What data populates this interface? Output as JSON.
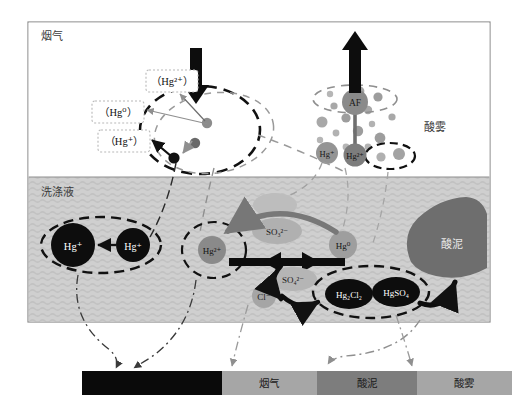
{
  "figure": {
    "zones": {
      "flue_gas_label": "烟气",
      "scrub_liquid_label": "洗涤液",
      "acid_mist_label": "酸雾",
      "acid_sludge_label": "酸泥"
    },
    "colors": {
      "frame_border": "#8a8a8a",
      "flue_gas_bg": "#ffffff",
      "scrub_liquid_bg": "#cfcfcf",
      "black": "#111111",
      "mid_gray": "#8c8c8c",
      "light_gray": "#b4b4b4",
      "dark_gray_blob": "#6e6e6e",
      "legend_dark": "#9a9a9a"
    }
  },
  "gas_zone": {
    "species_boxes": [
      {
        "id": "hg2plus",
        "label": "（Hg²⁺）",
        "x": 146,
        "y": 70
      },
      {
        "id": "hg0",
        "label": "（Hg⁰）",
        "x": 92,
        "y": 101
      },
      {
        "id": "hgplus",
        "label": "（Hg⁺）",
        "x": 98,
        "y": 130
      }
    ],
    "droplet_particles": [
      {
        "id": "gray-particle-upper",
        "label": "",
        "color": "#8c8c8c"
      },
      {
        "id": "gray-particle-mid",
        "label": "",
        "color": "#666666"
      },
      {
        "id": "black-particle",
        "label": "",
        "color": "#111111"
      }
    ],
    "arrows": {
      "inlet_label": "",
      "outlet_label": ""
    }
  },
  "acid_mist_cluster": {
    "af_label": "AF",
    "hg_plus_label": "Hg⁺",
    "hg_2plus_label": "Hg²⁺"
  },
  "liquid_zone": {
    "left_pair": [
      {
        "id": "hg-plus-left",
        "label": "Hg⁺"
      },
      {
        "id": "hg-plus-right",
        "label": "Hg⁺"
      }
    ],
    "center_species": [
      {
        "id": "hg-2plus-center",
        "label": "Hg²⁺"
      },
      {
        "id": "hg-0-right",
        "label": "Hg⁰"
      }
    ],
    "ions": [
      {
        "id": "so3",
        "label": "SO₃²⁻"
      },
      {
        "id": "so4",
        "label": "SO₄²⁻"
      },
      {
        "id": "cl",
        "label": "Cl⁻"
      }
    ],
    "precipitates": [
      {
        "id": "hg2cl2",
        "label": "Hg₂Cl₂"
      },
      {
        "id": "hgso4",
        "label": "HgSO₄"
      }
    ],
    "sludge_label": "酸泥"
  },
  "legend_bar": {
    "segments": [
      {
        "id": "seg-dark",
        "label": "",
        "color": "#0a0a0a",
        "text_color": "#0a0a0a",
        "width": 140
      },
      {
        "id": "seg-flue-gas",
        "label": "烟气",
        "color": "#a6a6a6",
        "text_color": "#1a1a1a",
        "width": 95
      },
      {
        "id": "seg-acid-sludge",
        "label": "酸泥",
        "color": "#7d7d7d",
        "text_color": "#1a1a1a",
        "width": 100
      },
      {
        "id": "seg-acid-mist",
        "label": "酸雾",
        "color": "#a6a6a6",
        "text_color": "#1a1a1a",
        "width": 95
      }
    ]
  }
}
